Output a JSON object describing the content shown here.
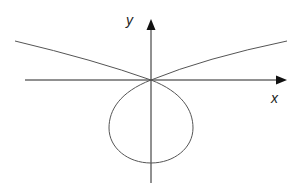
{
  "diagram": {
    "axes": {
      "x_label": "x",
      "y_label": "y"
    },
    "colors": {
      "axis": "#111111",
      "curve": "#444444",
      "background": "#ffffff"
    }
  }
}
